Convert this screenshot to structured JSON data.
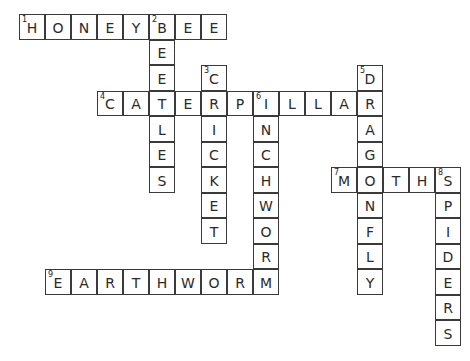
{
  "puzzle": {
    "type": "crossword",
    "grid": {
      "origin_x": 19,
      "origin_y": 14,
      "cell_w": 26,
      "cell_h": 25.5
    },
    "entries": [
      {
        "number": 1,
        "direction": "across",
        "answer": "HONEYBEE",
        "row": 0,
        "col": 0
      },
      {
        "number": 2,
        "direction": "down",
        "answer": "BEETLES",
        "row": 0,
        "col": 5
      },
      {
        "number": 3,
        "direction": "down",
        "answer": "CRICKET",
        "row": 2,
        "col": 7
      },
      {
        "number": 4,
        "direction": "across",
        "answer": "CATERPILLAR",
        "row": 3,
        "col": 3
      },
      {
        "number": 5,
        "direction": "down",
        "answer": "DRAGONFLY",
        "row": 2,
        "col": 13
      },
      {
        "number": 6,
        "direction": "down",
        "answer": "INCHWORM",
        "row": 3,
        "col": 9
      },
      {
        "number": 7,
        "direction": "across",
        "answer": "MOTHS",
        "row": 6,
        "col": 12
      },
      {
        "number": 8,
        "direction": "down",
        "answer": "SPIDERS",
        "row": 6,
        "col": 16
      },
      {
        "number": 9,
        "direction": "across",
        "answer": "EARTHWORM",
        "row": 10,
        "col": 1
      }
    ]
  }
}
